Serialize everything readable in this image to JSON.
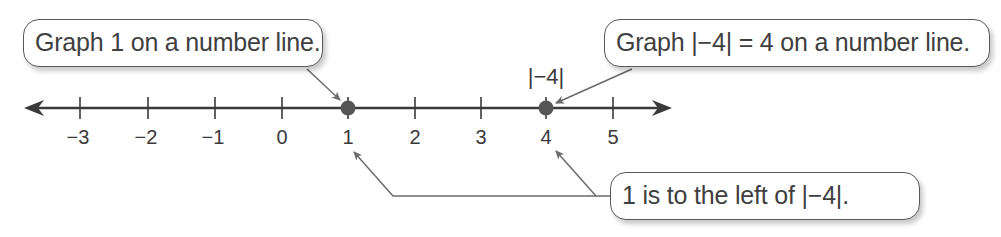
{
  "callouts": {
    "graph_one": "Graph 1 on a number line.",
    "graph_abs": "Graph |−4| = 4 on a number line.",
    "comparison": "1 is to the left of |−4|."
  },
  "number_line": {
    "ticks": [
      "−3",
      "−2",
      "−1",
      "0",
      "1",
      "2",
      "3",
      "4",
      "5"
    ],
    "plotted_points": [
      {
        "value": 1,
        "label": ""
      },
      {
        "value": 4,
        "label": "|−4|"
      }
    ],
    "abs_label": "|−4|"
  },
  "colors": {
    "axis": "#3a3a3a",
    "point": "#555555",
    "arrow": "#6b6b6b"
  }
}
